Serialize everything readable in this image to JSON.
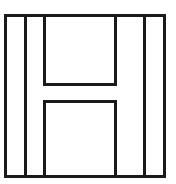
{
  "figure": {
    "canvas": {
      "width": 176,
      "height": 184,
      "background_color": "#ffffff"
    },
    "style": {
      "stroke_color": "#1a1a1a",
      "stroke_width": 3,
      "fill": "none"
    },
    "shapes": [
      {
        "name": "outer-square-border",
        "type": "rect",
        "x": 5.5,
        "y": 15.5,
        "width": 159,
        "height": 161
      },
      {
        "name": "h-glyph-outline",
        "type": "path",
        "points": "44.5,15.5 44.5,84.5 115.5,84.5 115.5,15.5 144.5,15.5 144.5,176.5 115.5,176.5 115.5,101.5 44.5,101.5 44.5,176.5 25.5,176.5 25.5,15.5"
      },
      {
        "name": "left-stem-inner-divider",
        "type": "line",
        "x1": 25.5,
        "y1": 15.5,
        "x2": 25.5,
        "y2": 176.5
      },
      {
        "name": "right-stem-inner-divider",
        "type": "line",
        "x1": 144.5,
        "y1": 15.5,
        "x2": 144.5,
        "y2": 176.5
      },
      {
        "name": "upper-notch-rect",
        "type": "rect",
        "x": 44.5,
        "y": 15.5,
        "width": 71,
        "height": 69
      },
      {
        "name": "lower-notch-rect",
        "type": "rect",
        "x": 44.5,
        "y": 101.5,
        "width": 71,
        "height": 75
      }
    ],
    "labels": {
      "letter": "H",
      "caption": ""
    }
  }
}
